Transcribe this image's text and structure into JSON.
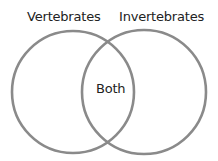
{
  "diagram": {
    "type": "venn",
    "sets": [
      {
        "label": "Vertebrates",
        "position": "left"
      },
      {
        "label": "Invertebrates",
        "position": "right"
      }
    ],
    "intersection_label": "Both",
    "stroke_color": "#8a8a8a",
    "background": "#ffffff"
  }
}
